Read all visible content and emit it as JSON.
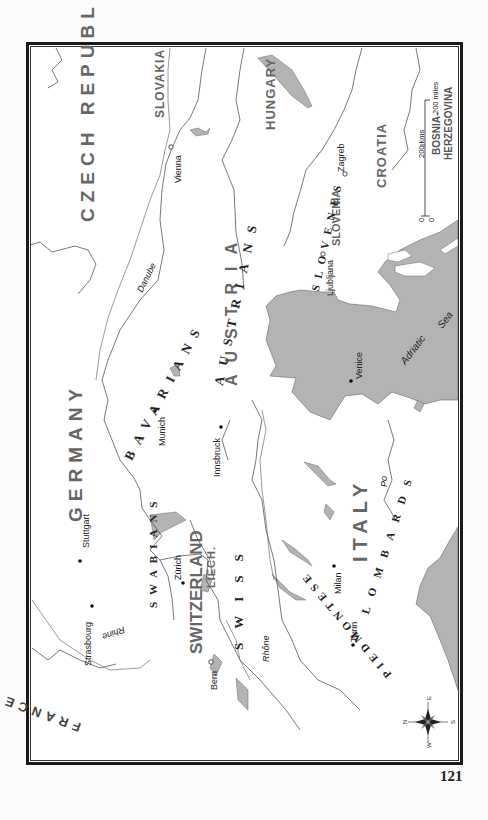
{
  "page": {
    "number": "121"
  },
  "map": {
    "orientation": "rotated 90° counter-clockwise",
    "colors": {
      "water": "#b3b3b3",
      "border_line": "#555555",
      "country_label": "#666666",
      "frame": "#1a1a1a"
    },
    "countries": {
      "czech_republic": "CZECH REPUBLIC",
      "slovakia": "SLOVAKIA",
      "hungary": "HUNGARY",
      "germany": "GERMANY",
      "austria": "AUSTRIA",
      "switzerland": "SWITZERLAND",
      "liech": "LIECH.",
      "italy": "ITALY",
      "slovenia": "SLOVENIA",
      "croatia": "CROATIA",
      "bosnia_line1": "BOSNIA-",
      "bosnia_line2": "HERZEGOVINA",
      "france": "FRANCE"
    },
    "peoples": {
      "bavarians": "BAVARIANS",
      "austrians": "AUSTRIANS",
      "swabians": "SWABIANS",
      "swiss": "SWISS",
      "slovenes": "SLOVENES",
      "lombards": "LOMBARDS",
      "piedmontese": "PIEDMONTESE"
    },
    "cities": {
      "vienna": "Vienna",
      "munich": "Munich",
      "innsbruck": "Innsbruck",
      "stuttgart": "Stuttgart",
      "zurich": "Zürich",
      "strasbourg": "Strasbourg",
      "bern": "Bern",
      "milan": "Milan",
      "turin": "Turin",
      "venice": "Venice",
      "ljubljana": "Ljubljana",
      "zagreb": "Zagreb"
    },
    "rivers": {
      "danube": "Danube",
      "rhine": "Rhine",
      "rhone": "Rhône",
      "po": "Po"
    },
    "seas": {
      "adriatic": "Adriatic",
      "sea": "Sea"
    },
    "scale": {
      "kms": "200 kms",
      "miles": "200 miles",
      "zero_a": "0",
      "zero_b": "0"
    },
    "compass": {
      "n": "N",
      "e": "E",
      "s": "S",
      "w": "W"
    }
  }
}
